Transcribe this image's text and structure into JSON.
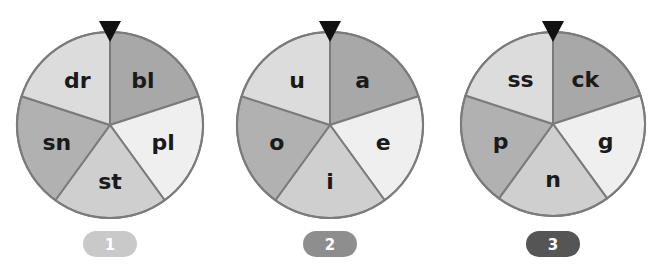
{
  "wheels": [
    {
      "number": "1",
      "badge_color": "#c9c9c9",
      "center": [
        110,
        125
      ],
      "radius": 93,
      "segments": [
        {
          "label": "bl",
          "color": "#a8a8a8"
        },
        {
          "label": "pl",
          "color": "#efefef"
        },
        {
          "label": "st",
          "color": "#cfcfcf"
        },
        {
          "label": "sn",
          "color": "#b1b1b1"
        },
        {
          "label": "dr",
          "color": "#dcdcdc"
        }
      ]
    },
    {
      "number": "2",
      "badge_color": "#8e8e8e",
      "center": [
        330,
        125
      ],
      "radius": 93,
      "segments": [
        {
          "label": "a",
          "color": "#a8a8a8"
        },
        {
          "label": "e",
          "color": "#efefef"
        },
        {
          "label": "i",
          "color": "#cfcfcf"
        },
        {
          "label": "o",
          "color": "#b1b1b1"
        },
        {
          "label": "u",
          "color": "#dcdcdc"
        }
      ]
    },
    {
      "number": "3",
      "badge_color": "#555555",
      "center": [
        553,
        124
      ],
      "radius": 92,
      "segments": [
        {
          "label": "ck",
          "color": "#a8a8a8"
        },
        {
          "label": "g",
          "color": "#efefef"
        },
        {
          "label": "n",
          "color": "#cfcfcf"
        },
        {
          "label": "p",
          "color": "#b1b1b1"
        },
        {
          "label": "ss",
          "color": "#dcdcdc"
        }
      ]
    }
  ],
  "colors": {
    "outline": "#7b7b7b",
    "pointer": "#111111",
    "label": "#1a1a1a"
  }
}
